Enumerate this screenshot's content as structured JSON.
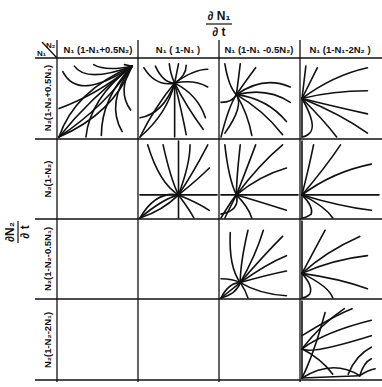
{
  "title_top": {
    "numerator": "∂ N₁",
    "denominator": "∂ t"
  },
  "title_left": {
    "numerator": "∂N₂",
    "denominator": "∂ t"
  },
  "corner": {
    "row_var": "N₁",
    "col_var": "N₂"
  },
  "columns": [
    "N₁ (1-N₁+0.5N₂)",
    "N₁ ( 1-N₁ )",
    "N₁ (1-N₁ -0.5N₂)",
    "N₁ (1-N₁-2N₂ )"
  ],
  "rows": [
    "N₂(1-N₂+0.5N₁)",
    "N₂(1-N₂)",
    "N₂(1-N₂-0.5N₁)",
    "N₂(1-N₂-2N₁)"
  ],
  "cells": [
    {
      "row": 0,
      "col": 0,
      "pattern": "outward-to-top-right"
    },
    {
      "row": 0,
      "col": 1,
      "pattern": "node-top-center"
    },
    {
      "row": 0,
      "col": 2,
      "pattern": "node-left-center"
    },
    {
      "row": 0,
      "col": 3,
      "pattern": "node-left-edge"
    },
    {
      "row": 1,
      "col": 1,
      "pattern": "node-center-axes"
    },
    {
      "row": 1,
      "col": 2,
      "pattern": "node-center-left"
    },
    {
      "row": 1,
      "col": 3,
      "pattern": "node-left-edge-mid"
    },
    {
      "row": 2,
      "col": 2,
      "pattern": "node-center-low"
    },
    {
      "row": 2,
      "col": 3,
      "pattern": "node-left-edge-low"
    },
    {
      "row": 3,
      "col": 3,
      "pattern": "bistable-diagonal"
    }
  ]
}
